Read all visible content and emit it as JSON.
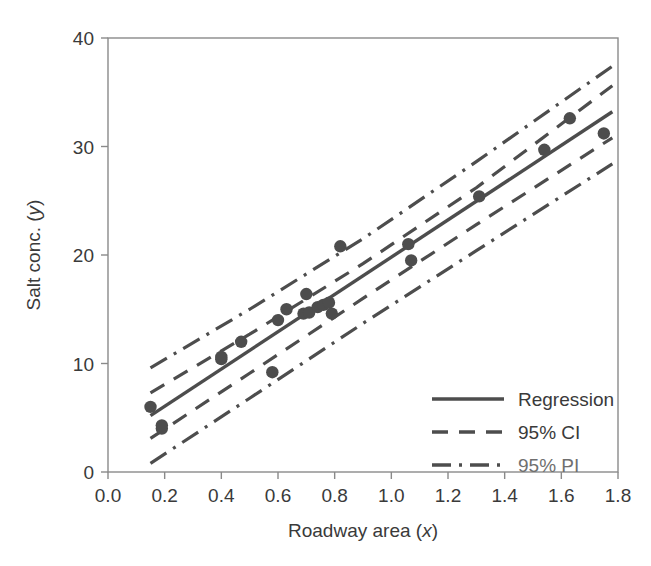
{
  "chart_data": {
    "type": "scatter",
    "title": "",
    "xlabel": "Roadway area (x)",
    "ylabel": "Salt conc. (y)",
    "xlabel_plain": "Roadway area",
    "xlabel_italic_var": "x",
    "ylabel_plain": "Salt conc.",
    "ylabel_italic_var": "y",
    "xlim": [
      0.0,
      1.8
    ],
    "ylim": [
      0,
      40
    ],
    "xticks": [
      0.0,
      0.2,
      0.4,
      0.6,
      0.8,
      1.0,
      1.2,
      1.4,
      1.6,
      1.8
    ],
    "xtick_labels": [
      "0.0",
      "0.2",
      "0.4",
      "0.6",
      "0.8",
      "1.0",
      "1.2",
      "1.4",
      "1.6",
      "1.8"
    ],
    "yticks": [
      0,
      10,
      20,
      30,
      40
    ],
    "ytick_labels": [
      "0",
      "10",
      "20",
      "30",
      "40"
    ],
    "grid": false,
    "legend_position": "lower right",
    "series": [
      {
        "name": "points",
        "kind": "scatter",
        "marker": "circle",
        "color": "#4d4d4d",
        "x": [
          0.15,
          0.19,
          0.19,
          0.4,
          0.4,
          0.47,
          0.58,
          0.6,
          0.63,
          0.69,
          0.7,
          0.71,
          0.74,
          0.76,
          0.78,
          0.79,
          0.82,
          1.06,
          1.07,
          1.31,
          1.54,
          1.63,
          1.75
        ],
        "y": [
          6.0,
          4.0,
          4.3,
          10.4,
          10.6,
          12.0,
          9.2,
          14.0,
          15.0,
          14.6,
          16.4,
          14.7,
          15.2,
          15.4,
          15.6,
          14.6,
          20.8,
          21.0,
          19.5,
          25.4,
          29.7,
          32.6,
          31.2
        ]
      },
      {
        "name": "Regression",
        "kind": "line",
        "style": "solid",
        "color": "#4d4d4d",
        "x": [
          0.15,
          1.78
        ],
        "y": [
          5.2,
          33.2
        ]
      },
      {
        "name": "95% CI",
        "kind": "band",
        "style": "dashed",
        "color": "#4d4d4d",
        "x": [
          0.15,
          0.5,
          0.9,
          1.3,
          1.78
        ],
        "upper": [
          7.3,
          12.7,
          19.2,
          26.2,
          35.6
        ],
        "lower": [
          3.1,
          9.1,
          16.0,
          22.8,
          30.8
        ]
      },
      {
        "name": "95% PI",
        "kind": "band",
        "style": "dashdot",
        "color": "#4d4d4d",
        "x": [
          0.15,
          0.5,
          0.9,
          1.3,
          1.78
        ],
        "upper": [
          9.6,
          15.0,
          21.5,
          28.6,
          37.4
        ],
        "lower": [
          0.8,
          6.8,
          13.7,
          20.4,
          28.4
        ]
      }
    ],
    "legend_entries": [
      {
        "label": "Regression",
        "style": "solid"
      },
      {
        "label": "95% CI",
        "style": "dashed"
      },
      {
        "label": "95% PI",
        "style": "dashdot"
      }
    ],
    "colors": {
      "ink": "#4d4d4d",
      "axis": "#8a8a8a",
      "text": "#3a3a3a",
      "background": "#ffffff"
    }
  }
}
